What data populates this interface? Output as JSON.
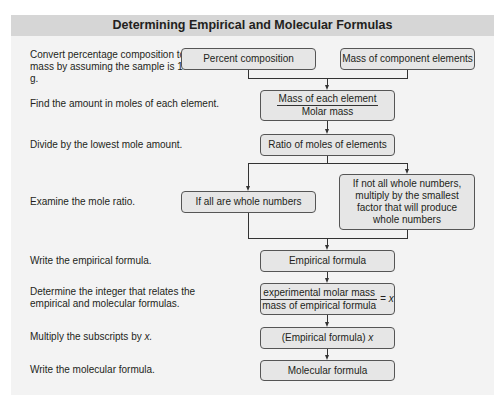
{
  "title": "Determining Empirical and Molecular Formulas",
  "steps": [
    "Convert percentage composition to mass by assuming the sample is 100 g.",
    "Find the amount in moles of each element.",
    "Divide by the lowest mole amount.",
    "Examine the mole ratio.",
    "Write the empirical formula.",
    "Determine the integer that relates the empirical and molecular formulas.",
    "Multiply the subscripts by ",
    "Write the molecular formula."
  ],
  "step7_var": "x.",
  "boxes": {
    "percent_composition": "Percent composition",
    "mass_of_component_elements": "Mass of component elements",
    "mass_numerator": "Mass of each element",
    "mass_denominator": "Molar mass",
    "ratio": "Ratio of moles of elements",
    "whole": "If all are whole numbers",
    "not_whole": "If not all whole numbers, multiply by the smallest factor that will produce whole numbers",
    "empirical_formula": "Empirical formula",
    "exp_numerator": "experimental molar mass",
    "exp_denominator": "mass of empirical formula",
    "exp_result": "= x",
    "empirical_times": "(Empirical formula) ",
    "empirical_times_var": "x",
    "molecular_formula": "Molecular formula"
  }
}
